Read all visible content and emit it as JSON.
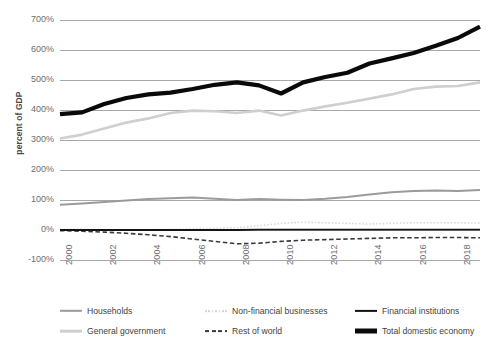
{
  "chart_data": {
    "type": "line",
    "title": "",
    "xlabel": "",
    "ylabel": "percent of GDP",
    "ylim": [
      -100,
      700
    ],
    "xlim": [
      2000,
      2019
    ],
    "grid": true,
    "legend_position": "bottom",
    "y_ticks": [
      "700%",
      "600%",
      "500%",
      "400%",
      "300%",
      "200%",
      "100%",
      "0%",
      "-100%"
    ],
    "y_tick_values": [
      700,
      600,
      500,
      400,
      300,
      200,
      100,
      0,
      -100
    ],
    "x_ticks": [
      "2000",
      "2002",
      "2004",
      "2006",
      "2008",
      "2010",
      "2012",
      "2014",
      "2016",
      "2018"
    ],
    "x_tick_values": [
      2000,
      2002,
      2004,
      2006,
      2008,
      2010,
      2012,
      2014,
      2016,
      2018
    ],
    "x": [
      2000,
      2001,
      2002,
      2003,
      2004,
      2005,
      2006,
      2007,
      2008,
      2009,
      2010,
      2011,
      2012,
      2013,
      2014,
      2015,
      2016,
      2017,
      2018,
      2019
    ],
    "series": [
      {
        "name": "Households",
        "color": "#9b9b9b",
        "style": "solid",
        "width": 2.0,
        "values": [
          84,
          88,
          93,
          98,
          103,
          106,
          108,
          104,
          100,
          103,
          101,
          100,
          104,
          110,
          118,
          126,
          130,
          132,
          130,
          133
        ]
      },
      {
        "name": "General government",
        "color": "#cfcfcf",
        "style": "solid",
        "width": 2.6,
        "values": [
          305,
          318,
          338,
          358,
          372,
          390,
          398,
          396,
          390,
          398,
          382,
          398,
          412,
          424,
          438,
          452,
          470,
          478,
          480,
          492
        ]
      },
      {
        "name": "Non-financial businesses",
        "color": "#d9d9d9",
        "style": "dotted",
        "width": 1.6,
        "values": [
          2,
          2,
          1,
          1,
          1,
          2,
          3,
          5,
          8,
          14,
          22,
          26,
          24,
          22,
          20,
          22,
          24,
          24,
          24,
          23
        ]
      },
      {
        "name": "Rest of world",
        "color": "#3a3a3a",
        "style": "dashed",
        "width": 1.6,
        "values": [
          -2,
          -4,
          -7,
          -11,
          -16,
          -22,
          -30,
          -38,
          -46,
          -44,
          -38,
          -34,
          -32,
          -30,
          -28,
          -26,
          -26,
          -25,
          -25,
          -26
        ]
      },
      {
        "name": "Financial institutions",
        "color": "#141414",
        "style": "solid",
        "width": 1.8,
        "values": [
          0,
          0,
          0,
          0,
          0,
          0,
          0,
          0,
          0,
          1,
          1,
          1,
          1,
          1,
          1,
          1,
          1,
          1,
          1,
          1
        ]
      },
      {
        "name": "Total domestic economy",
        "color": "#0a0a0a",
        "style": "solid",
        "width": 4.2,
        "values": [
          386,
          392,
          420,
          440,
          452,
          458,
          470,
          484,
          492,
          482,
          455,
          492,
          510,
          524,
          555,
          572,
          590,
          614,
          640,
          678
        ]
      }
    ]
  },
  "legend": {
    "items": [
      {
        "label": "Households",
        "swatch": "solid-medium-gray-line"
      },
      {
        "label": "Non-financial businesses",
        "swatch": "dotted-light-gray-line"
      },
      {
        "label": "Financial institutions",
        "swatch": "solid-thin-black-line"
      },
      {
        "label": "General government",
        "swatch": "solid-light-gray-line"
      },
      {
        "label": "Rest of world",
        "swatch": "dashed-dark-line"
      },
      {
        "label": "Total domestic economy",
        "swatch": "solid-thick-black-line"
      }
    ]
  }
}
